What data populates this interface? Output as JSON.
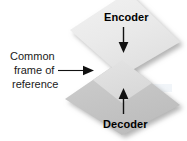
{
  "diagram": {
    "background_color": "#ffffff",
    "width": 187,
    "height": 141,
    "nodes": {
      "encoder": {
        "label": "Encoder",
        "shape": "diamond",
        "fill_color": "#eaeaea",
        "text_color": "#000000"
      },
      "decoder": {
        "label": "Decoder",
        "shape": "diamond",
        "fill_color": "#c6c6c6",
        "text_color": "#000000"
      },
      "overlap": {
        "label": "",
        "shape": "diamond",
        "fill_color": "#dedede"
      }
    },
    "callout": {
      "line1": "Common",
      "line2": "frame of",
      "line3": "reference",
      "text_color": "#1a1a1a"
    },
    "arrows": {
      "encoder_to_center": {
        "name": "down-arrow",
        "direction": "down",
        "color": "#111111"
      },
      "decoder_to_center": {
        "name": "up-arrow",
        "direction": "up",
        "color": "#111111"
      },
      "callout_to_center": {
        "name": "right-arrow",
        "direction": "right",
        "color": "#111111"
      }
    }
  }
}
